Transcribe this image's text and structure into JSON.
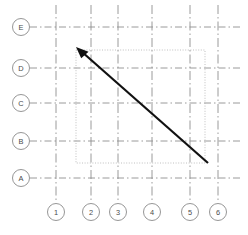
{
  "drawing": {
    "title": "Structural Column Grid Plan",
    "canvas": {
      "width": 248,
      "height": 235,
      "background": "#ffffff"
    },
    "colors": {
      "gridline": "#8e8e8e",
      "bubble_stroke": "#8a8a8a",
      "bubble_fill": "#ffffff",
      "label_text": "#4a4a4a",
      "boundary_dotted": "#b9b9b9",
      "arrow": "#111111"
    },
    "row_grid": {
      "axis_label": "Row Grid Lines",
      "bubble_cx": 21,
      "bubble_r": 8.5,
      "line_x_start": 30,
      "line_x_end": 241,
      "items": [
        {
          "label": "E",
          "y": 27
        },
        {
          "label": "D",
          "y": 68
        },
        {
          "label": "C",
          "y": 103
        },
        {
          "label": "B",
          "y": 141
        },
        {
          "label": "A",
          "y": 178
        }
      ]
    },
    "column_grid": {
      "axis_label": "Column Grid Lines",
      "bubble_cy": 212,
      "bubble_r": 8.5,
      "line_y_start": 5,
      "line_y_end": 203,
      "items": [
        {
          "label": "1",
          "x": 56
        },
        {
          "label": "2",
          "x": 91
        },
        {
          "label": "3",
          "x": 118
        },
        {
          "label": "4",
          "x": 152
        },
        {
          "label": "5",
          "x": 190
        },
        {
          "label": "6",
          "x": 218
        }
      ]
    },
    "boundary_rect": {
      "name": "dotted-boundary",
      "x": 76,
      "y": 50,
      "width": 129,
      "height": 113
    },
    "arrow": {
      "name": "leader-arrow",
      "tail_x": 208,
      "tail_y": 163,
      "head_x": 76,
      "head_y": 47,
      "stroke_width": 2.2,
      "head_size": 9
    }
  }
}
